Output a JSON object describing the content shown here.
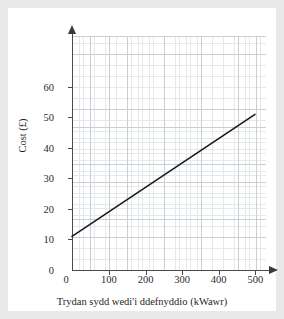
{
  "figure": {
    "background_color": "#e9e9e9",
    "panel_color": "#ffffff",
    "line_color": "#1a1a1a",
    "axis_color": "#4a4a4a",
    "grid_major_color": "#c9cfd4",
    "grid_minor_color": "#e4e9ec"
  },
  "chart_data": {
    "type": "line",
    "title": "",
    "subtitle": "",
    "xlabel": "Trydan sydd wedi'i ddefnyddio (kWawr)",
    "ylabel": "Cost (£)",
    "xlim": [
      0,
      540
    ],
    "ylim": [
      0,
      64
    ],
    "xticks": [
      0,
      100,
      200,
      300,
      400,
      500
    ],
    "xtick_labels": [
      "0",
      "100",
      "200",
      "300",
      "400",
      "500"
    ],
    "yticks": [
      0,
      10,
      20,
      30,
      40,
      50,
      60
    ],
    "ytick_labels": [
      "0",
      "10",
      "20",
      "30",
      "40",
      "50",
      "60"
    ],
    "grid": true,
    "grid_style": "graph-paper",
    "minor_grid": true,
    "legend": false,
    "legend_position": "none",
    "series": [
      {
        "name": "Cost",
        "x": [
          0,
          500
        ],
        "y": [
          11,
          51
        ],
        "intercept": 11,
        "slope": 0.08,
        "color": "#1a1a1a",
        "linewidth": 1.6
      }
    ],
    "annotations": []
  }
}
